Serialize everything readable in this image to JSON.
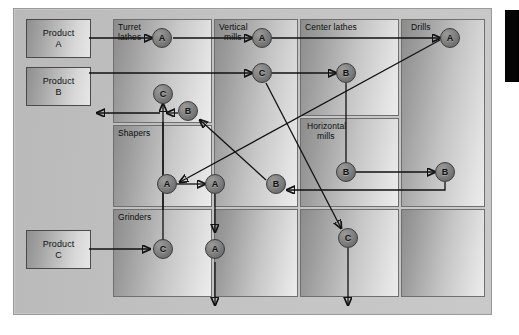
{
  "diagram": {
    "type": "process-layout-flow",
    "colors": {
      "background": "#ffffff",
      "frame": "#c2c2c2",
      "department": "#c6c6c6",
      "node": "#7a7a7a",
      "arrow": "#111111",
      "accent_bar": "#050505"
    }
  },
  "products": [
    {
      "id": "product-a",
      "line1": "Product",
      "line2": "A"
    },
    {
      "id": "product-b",
      "line1": "Product",
      "line2": "B"
    },
    {
      "id": "product-c",
      "line1": "Product",
      "line2": "C"
    }
  ],
  "departments": [
    {
      "id": "turret-lathes",
      "label_line1": "Turret",
      "label_line2": "lathes"
    },
    {
      "id": "vertical-mills",
      "label_line1": "Vertical",
      "label_line2": "mills"
    },
    {
      "id": "center-lathes",
      "label_line1": "Center lathes",
      "label_line2": ""
    },
    {
      "id": "drills",
      "label_line1": "Drills",
      "label_line2": ""
    },
    {
      "id": "shapers",
      "label_line1": "Shapers",
      "label_line2": ""
    },
    {
      "id": "horizontal-mills",
      "label_line1": "Horizontal",
      "label_line2": "mills"
    },
    {
      "id": "grinders",
      "label_line1": "Grinders",
      "label_line2": ""
    }
  ],
  "nodes": [
    {
      "id": "n1",
      "label": "A",
      "department": "turret-lathes"
    },
    {
      "id": "n2",
      "label": "A",
      "department": "vertical-mills"
    },
    {
      "id": "n3",
      "label": "A",
      "department": "drills"
    },
    {
      "id": "n4",
      "label": "B",
      "department": "center-lathes"
    },
    {
      "id": "n5",
      "label": "C",
      "department": "turret-lathes"
    },
    {
      "id": "n6",
      "label": "B",
      "department": "turret-lathes"
    },
    {
      "id": "n7",
      "label": "C",
      "department": "vertical-mills"
    },
    {
      "id": "n8",
      "label": "B",
      "department": "horizontal-mills"
    },
    {
      "id": "n9",
      "label": "B",
      "department": "drills"
    },
    {
      "id": "n10",
      "label": "A",
      "department": "shapers"
    },
    {
      "id": "n11",
      "label": "A",
      "department": "vertical-mills"
    },
    {
      "id": "n12",
      "label": "B",
      "department": "vertical-mills"
    },
    {
      "id": "n13",
      "label": "C",
      "department": "grinders"
    },
    {
      "id": "n14",
      "label": "A",
      "department": "vertical-mills"
    },
    {
      "id": "n15",
      "label": "C",
      "department": "center-lathes"
    }
  ],
  "legend_text": {
    "note": ""
  }
}
